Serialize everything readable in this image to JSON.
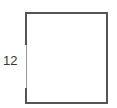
{
  "diagram": {
    "shape": "rectangle",
    "side_label": "12",
    "stroke_color": "#555555",
    "label_color": "#333333"
  }
}
